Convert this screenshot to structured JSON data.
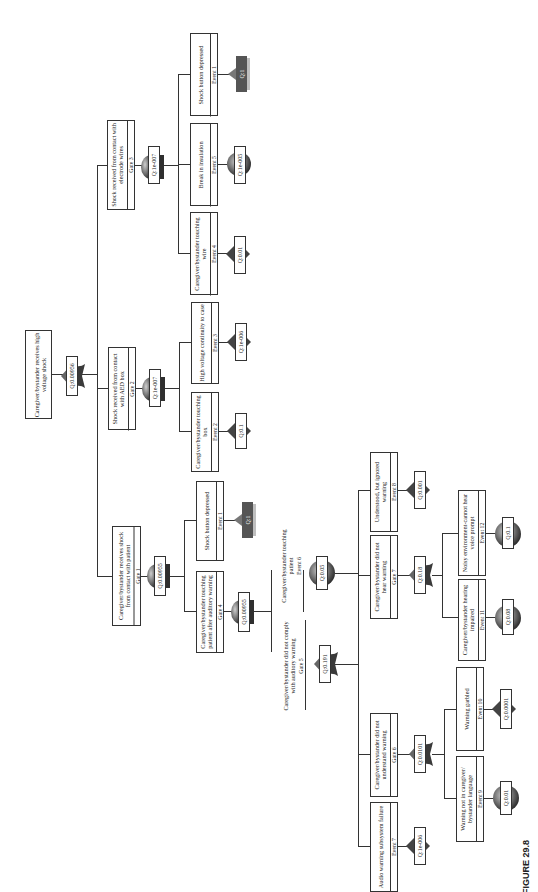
{
  "figure": {
    "caption": "FIGURE 29.8"
  },
  "colors": {
    "line": "#333333",
    "gate_dark": "#3a3a3a",
    "gate_grad_light": "#bdbdbd",
    "event_q1": "#555555",
    "event_q1_shadow": "#bfbfbf"
  },
  "nodes": {
    "top": {
      "desc": "Caregiver/bystander receives high voltage shock",
      "q": "Q:0.00956",
      "gate_type": "or"
    },
    "gate1": {
      "desc": "Caregiver/bystander receives shock from contact with patient",
      "tag": "Gate 1",
      "q": "Q:0.00955",
      "gate_type": "and"
    },
    "gate2": {
      "desc": "Shock received from contact with AED box",
      "tag": "Gate 2",
      "q": "Q:1e-007",
      "gate_type": "and"
    },
    "gate3": {
      "desc": "Shock received from contact with electrode wires",
      "tag": "Gate 3",
      "q": "Q:1e-007",
      "gate_type": "and"
    },
    "g3_event4": {
      "desc": "Caregiver/bystander touching wire",
      "tag": "Event 4",
      "q": "Q:0.01",
      "event_type": "diamond"
    },
    "g3_event5": {
      "desc": "Break in insulation",
      "tag": "Event 5",
      "q": "Q:1e-005",
      "event_type": "circle"
    },
    "g3_event1": {
      "desc": "Shock button depressed",
      "tag": "Event 1",
      "q": "Q:1",
      "event_type": "house"
    },
    "g2_event2": {
      "desc": "Caregiver/bystander touching box",
      "tag": "Event 2",
      "q": "Q:0.1",
      "event_type": "diamond"
    },
    "g2_event3": {
      "desc": "High voltage continuity to case",
      "tag": "Event 3",
      "q": "Q:1e-006",
      "event_type": "diamond"
    },
    "g1_event1": {
      "desc": "Shock button depressed",
      "tag": "Event 1",
      "q": "Q:1",
      "event_type": "house"
    },
    "gate4": {
      "desc": "Caregiver/bystander touching patient after auditory warning",
      "tag": "Gate 4",
      "q": "Q:0.00955",
      "gate_type": "and"
    },
    "gate5": {
      "desc": "Caregiver/bystander did not comply with auditory warning",
      "tag": "Gate 5",
      "q": "Q:0.191",
      "gate_type": "or"
    },
    "event6": {
      "desc": "Caregiver/bystander touching patient",
      "tag": "Event 6",
      "q": "Q:0.05",
      "event_type": "circle"
    },
    "event7": {
      "desc": "Audio warning subsystem failure",
      "tag": "Event 7",
      "q": "Q:1e-006",
      "event_type": "diamond"
    },
    "gate6": {
      "desc": "Caregiver/bystander did not understand warning",
      "tag": "Gate 6",
      "q": "Q:0.0101",
      "gate_type": "or"
    },
    "gate7": {
      "desc": "Caregiver/bystander did not hear warning",
      "tag": "Gate 7",
      "q": "Q:0.18",
      "gate_type": "or"
    },
    "event8": {
      "desc": "Understood, but ignored warning",
      "tag": "Event 8",
      "q": "Q:0.001",
      "event_type": "diamond"
    },
    "event9": {
      "desc": "Warning not in caregiver/ bystander language",
      "tag": "Event 9",
      "q": "Q:0.01",
      "event_type": "circle"
    },
    "event10": {
      "desc": "Warning garbled",
      "tag": "Event 10",
      "q": "Q:0.0001",
      "event_type": "diamond"
    },
    "event11": {
      "desc": "Caregiver/bystander hearing impaired",
      "tag": "Event 11",
      "q": "Q:0.08",
      "event_type": "circle"
    },
    "event12": {
      "desc": "Noisy environment-cannot hear voice prompt",
      "tag": "Event 12",
      "q": "Q:0.1",
      "event_type": "circle"
    }
  }
}
